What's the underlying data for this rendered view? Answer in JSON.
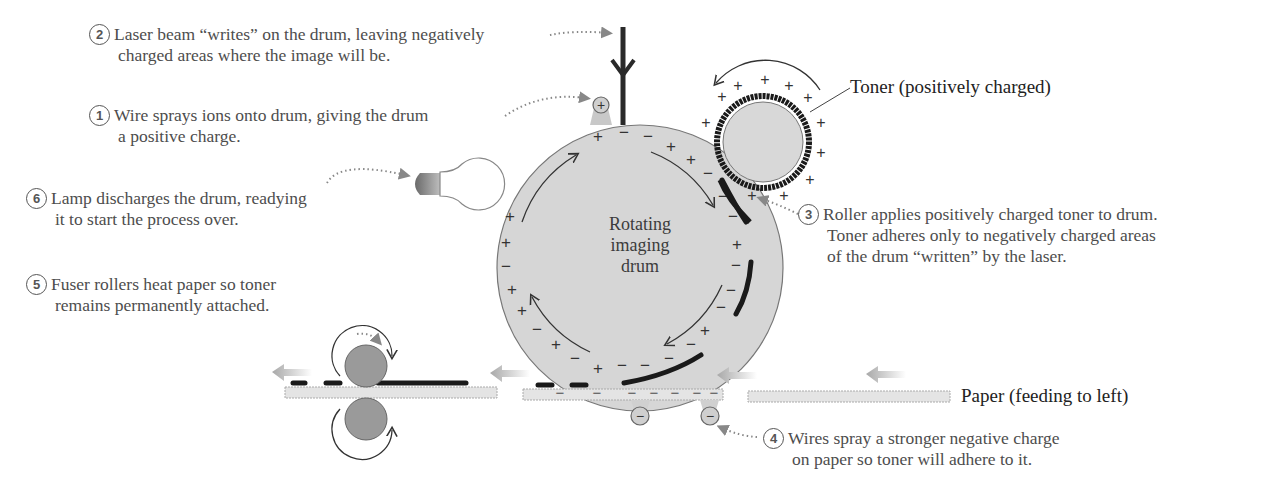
{
  "diagram": {
    "drum_label": [
      "Rotating",
      "imaging",
      "drum"
    ],
    "toner_label": "Toner (positively charged)",
    "paper_label": "Paper (feeding to left)",
    "steps": [
      {
        "number": "1",
        "line1": "Wire sprays ions onto drum, giving the drum",
        "line2": "a positive charge."
      },
      {
        "number": "2",
        "line1": "Laser beam “writes” on the drum, leaving negatively",
        "line2": "charged areas where the image will be."
      },
      {
        "number": "3",
        "line1": "Roller applies positively charged toner to drum.",
        "line2": "Toner adheres only to negatively charged areas",
        "line3": "of the drum “written” by the laser."
      },
      {
        "number": "4",
        "line1": "Wires spray a stronger negative charge",
        "line2": "on paper so toner will adhere to it."
      },
      {
        "number": "5",
        "line1": "Fuser rollers heat paper so toner",
        "line2": "remains permanently attached."
      },
      {
        "number": "6",
        "line1": "Lamp discharges the drum, readying",
        "line2": "it to start the process over."
      }
    ],
    "charge_symbols": {
      "positive": "+",
      "negative": "−"
    },
    "colors": {
      "drum_fill": "#d6d6d6",
      "toner_fill": "#d8d8d8",
      "fuser_fill": "#9a9a9a",
      "paper_fill": "#e4e4e4",
      "toner_black": "#1a1a1a",
      "arrow_gray": "#b0b0b0",
      "text": "#4d4d4d"
    }
  }
}
